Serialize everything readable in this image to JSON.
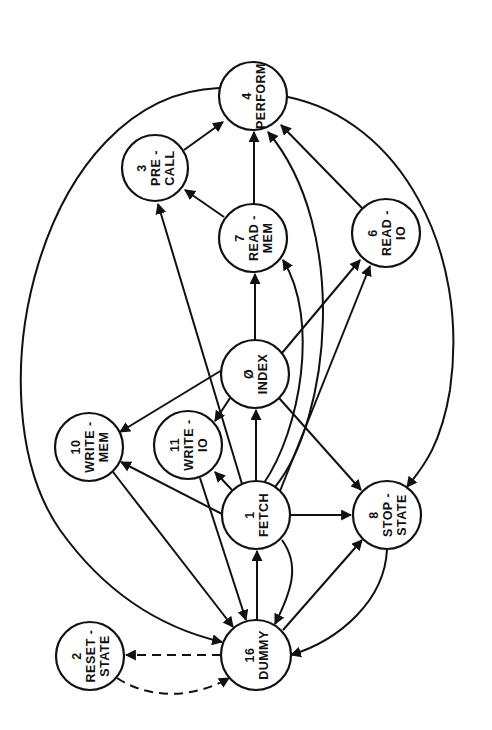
{
  "diagram": {
    "type": "state-transition-graph",
    "orientation": "rotated -90deg",
    "stroke_color": "#111111",
    "background": "#ffffff",
    "nodes": [
      {
        "id": "n4",
        "number": "4",
        "line1": "PERFORM",
        "line2": "",
        "cx": 253,
        "cy": 96,
        "r": 34
      },
      {
        "id": "n3",
        "number": "3",
        "line1": "PRE -",
        "line2": "CALL",
        "cx": 155,
        "cy": 168,
        "r": 33
      },
      {
        "id": "n7",
        "number": "7",
        "line1": "READ -",
        "line2": "MEM",
        "cx": 253,
        "cy": 238,
        "r": 34
      },
      {
        "id": "n6",
        "number": "6",
        "line1": "READ -",
        "line2": "IO",
        "cx": 386,
        "cy": 233,
        "r": 34
      },
      {
        "id": "n0",
        "number": "Ø",
        "line1": "INDEX",
        "line2": "",
        "cx": 255,
        "cy": 374,
        "r": 34
      },
      {
        "id": "n10",
        "number": "10",
        "line1": "WRITE -",
        "line2": "MEM",
        "cx": 89,
        "cy": 447,
        "r": 34
      },
      {
        "id": "n11",
        "number": "11",
        "line1": "WRITE -",
        "line2": "IO",
        "cx": 188,
        "cy": 445,
        "r": 34
      },
      {
        "id": "n1",
        "number": "1",
        "line1": "FETCH",
        "line2": "",
        "cx": 256,
        "cy": 515,
        "r": 34
      },
      {
        "id": "n8",
        "number": "8",
        "line1": "STOP -",
        "line2": "STATE",
        "cx": 387,
        "cy": 515,
        "r": 34
      },
      {
        "id": "n2",
        "number": "2",
        "line1": "RESET -",
        "line2": "STATE",
        "cx": 90,
        "cy": 656,
        "r": 34
      },
      {
        "id": "n16",
        "number": "16",
        "line1": "DUMMY",
        "line2": "",
        "cx": 256,
        "cy": 655,
        "r": 35
      }
    ],
    "edges": [
      {
        "from": "PRE-CALL",
        "to": "PERFORM",
        "style": "solid"
      },
      {
        "from": "READ-MEM",
        "to": "PERFORM",
        "style": "solid"
      },
      {
        "from": "READ-MEM",
        "to": "PRE-CALL",
        "style": "solid"
      },
      {
        "from": "READ-IO",
        "to": "PERFORM",
        "style": "solid"
      },
      {
        "from": "FETCH",
        "to": "PERFORM",
        "style": "solid",
        "curved": true
      },
      {
        "from": "FETCH",
        "to": "PRE-CALL",
        "style": "solid"
      },
      {
        "from": "FETCH",
        "to": "READ-MEM",
        "style": "solid",
        "curved": true
      },
      {
        "from": "FETCH",
        "to": "READ-IO",
        "style": "solid"
      },
      {
        "from": "FETCH",
        "to": "INDEX",
        "style": "solid"
      },
      {
        "from": "FETCH",
        "to": "WRITE-IO",
        "style": "solid"
      },
      {
        "from": "FETCH",
        "to": "WRITE-MEM",
        "style": "solid"
      },
      {
        "from": "FETCH",
        "to": "STOP-STATE",
        "style": "solid"
      },
      {
        "from": "FETCH",
        "to": "DUMMY",
        "style": "solid",
        "curved": true
      },
      {
        "from": "INDEX",
        "to": "READ-MEM",
        "style": "solid"
      },
      {
        "from": "INDEX",
        "to": "READ-IO",
        "style": "solid"
      },
      {
        "from": "INDEX",
        "to": "WRITE-MEM",
        "style": "solid"
      },
      {
        "from": "INDEX",
        "to": "WRITE-IO",
        "style": "solid"
      },
      {
        "from": "INDEX",
        "to": "STOP-STATE",
        "style": "solid"
      },
      {
        "from": "WRITE-MEM",
        "to": "DUMMY",
        "style": "solid"
      },
      {
        "from": "WRITE-IO",
        "to": "DUMMY",
        "style": "solid"
      },
      {
        "from": "PERFORM",
        "to": "DUMMY",
        "style": "solid",
        "curved": true
      },
      {
        "from": "PERFORM",
        "to": "STOP-STATE",
        "style": "solid",
        "curved": true
      },
      {
        "from": "DUMMY",
        "to": "FETCH",
        "style": "solid"
      },
      {
        "from": "DUMMY",
        "to": "STOP-STATE",
        "style": "solid"
      },
      {
        "from": "STOP-STATE",
        "to": "DUMMY",
        "style": "solid",
        "curved": true
      },
      {
        "from": "DUMMY",
        "to": "RESET-STATE",
        "style": "dashed"
      },
      {
        "from": "RESET-STATE",
        "to": "DUMMY",
        "style": "dashed",
        "curved": true
      }
    ]
  }
}
